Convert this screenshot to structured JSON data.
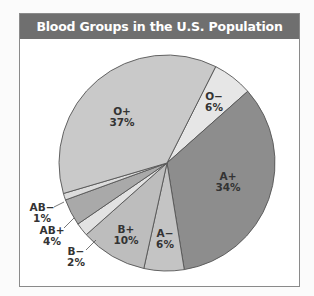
{
  "title": "Blood Groups in the U.S. Population",
  "chart_data": {
    "type": "pie",
    "title": "Blood Groups in the U.S. Population",
    "categories": [
      "O−",
      "A+",
      "A−",
      "B+",
      "B−",
      "AB+",
      "AB−",
      "O+"
    ],
    "values": [
      6,
      34,
      6,
      10,
      2,
      4,
      1,
      37
    ],
    "unit": "%",
    "colors": [
      "#e6e6e6",
      "#8d8d8d",
      "#c4c4c4",
      "#bdbdbd",
      "#e2e2e2",
      "#a9a9a9",
      "#dcdcdc",
      "#c9c9c9"
    ],
    "start_angle_deg": 26.8,
    "labels": [
      {
        "name": "O−",
        "pct": "6%"
      },
      {
        "name": "A+",
        "pct": "34%"
      },
      {
        "name": "A−",
        "pct": "6%"
      },
      {
        "name": "B+",
        "pct": "10%"
      },
      {
        "name": "B−",
        "pct": "2%"
      },
      {
        "name": "AB+",
        "pct": "4%"
      },
      {
        "name": "AB−",
        "pct": "1%"
      },
      {
        "name": "O+",
        "pct": "37%"
      }
    ]
  }
}
